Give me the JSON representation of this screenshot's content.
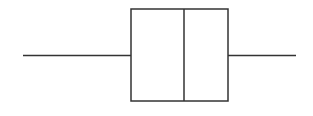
{
  "chart_data": {
    "type": "box",
    "orientation": "horizontal",
    "title": "",
    "xlabel": "",
    "ylabel": "",
    "grid": false,
    "legend": null,
    "series": [
      {
        "name": "",
        "min": 23,
        "q1": 131,
        "median": 184,
        "q3": 228,
        "max": 296
      }
    ],
    "pixel_geometry": {
      "center_y": 55.5,
      "box_top": 9,
      "box_bottom": 101
    }
  },
  "style": {
    "stroke_color": "#333333",
    "background": "#ffffff",
    "stroke_width": 1.5
  }
}
